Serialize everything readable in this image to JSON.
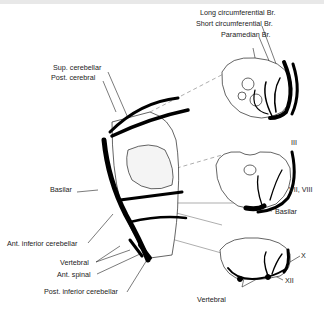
{
  "figure": {
    "labels": {
      "long_circumferential": "Long circumferential Br.",
      "short_circumferential": "Short circumferential Br.",
      "paramedian": "Paramedian Br.",
      "sup_cerebellar": "Sup. cerebellar",
      "post_cerebral": "Post. cerebral",
      "basilar_left": "Basilar",
      "ant_inferior_cerebellar": "Ant. inferior cerebellar",
      "vertebral_left": "Vertebral",
      "ant_spinal": "Ant. spinal",
      "post_inferior_cerebellar": "Post. inferior cerebellar",
      "cn_iii": "III",
      "cn_vii_viii": "VII, VIII",
      "basilar_right": "Basilar",
      "cn_x": "X",
      "cn_xii": "XII",
      "vertebral_right": "Vertebral"
    }
  }
}
